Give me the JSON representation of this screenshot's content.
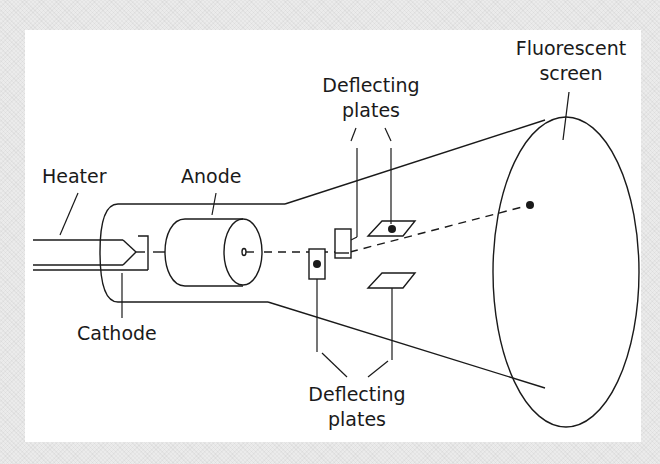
{
  "diagram": {
    "colors": {
      "stroke": "#1a1a1a",
      "panel": "#ffffff",
      "background": "#ebebeb"
    },
    "labels": {
      "heater": "Heater",
      "anode": "Anode",
      "cathode": "Cathode",
      "deflecting_top_line1": "Deflecting",
      "deflecting_top_line2": "plates",
      "deflecting_bottom_line1": "Deflecting",
      "deflecting_bottom_line2": "plates",
      "screen_line1": "Fluorescent",
      "screen_line2": "screen"
    }
  }
}
